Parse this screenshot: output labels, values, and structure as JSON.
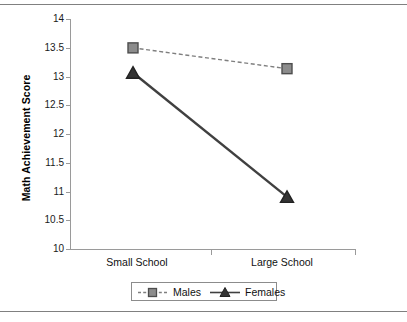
{
  "chart_data": {
    "type": "line",
    "title": "",
    "xlabel": "",
    "ylabel": "Math Achievement Score",
    "categories": [
      "Small School",
      "Large School"
    ],
    "ylim": [
      10,
      14
    ],
    "yticks": [
      14,
      13.5,
      13,
      12.5,
      12,
      11.5,
      11,
      10.5,
      10
    ],
    "ytick_labels": [
      "14",
      "13.5",
      "13",
      "12.5",
      "12",
      "11.5",
      "11",
      "10.5",
      "10"
    ],
    "grid": false,
    "legend_position": "bottom",
    "series": [
      {
        "name": "Males",
        "values": [
          13.5,
          13.14
        ],
        "marker": "square",
        "linestyle": "dashed",
        "color": "#7f7f7f",
        "marker_fill": "#8c8c8c",
        "marker_edge": "#4d4d4d"
      },
      {
        "name": "Females",
        "values": [
          13.07,
          10.92
        ],
        "marker": "triangle",
        "linestyle": "solid",
        "color": "#404040",
        "marker_fill": "#333333",
        "marker_edge": "#222222"
      }
    ]
  },
  "axis": {
    "y_title": "Math Achievement Score",
    "tick_0": "14",
    "tick_1": "13.5",
    "tick_2": "13",
    "tick_3": "12.5",
    "tick_4": "12",
    "tick_5": "11.5",
    "tick_6": "11",
    "tick_7": "10.5",
    "tick_8": "10",
    "cat_0": "Small School",
    "cat_1": "Large School"
  },
  "legend": {
    "males_label": "Males",
    "females_label": "Females"
  },
  "colors": {
    "males_line": "#7f7f7f",
    "females_line": "#404040",
    "axis": "#9a9a9a",
    "rule": "#808080",
    "text": "#111111"
  }
}
